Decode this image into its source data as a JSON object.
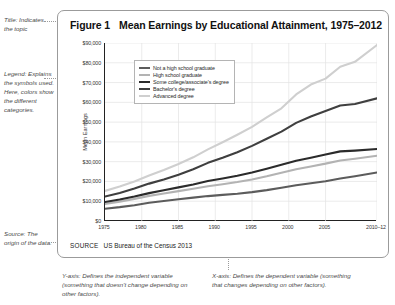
{
  "annotations": {
    "title_note": "Title: Indicates the topic",
    "legend_note": "Legend: Explains the symbols used. Here, colors show the different categories.",
    "source_note": "Source: The origin of the data.",
    "yaxis_note": "Y-axis: Defines the independent variable (something that doesn't change depending on other factors).",
    "xaxis_note": "X-axis: Defines the dependent variable (something that changes depending on other factors)."
  },
  "figure": {
    "number_label": "Figure 1",
    "title": "Mean Earnings by Educational Attainment, 1975–2012",
    "source_label": "SOURCE",
    "source_text": "US Bureau of the Census 2013"
  },
  "chart_data": {
    "type": "line",
    "title": "Mean Earnings by Educational Attainment, 1975–2012",
    "xlabel": "",
    "ylabel": "Mean Earnings",
    "xlim": [
      1975,
      2012
    ],
    "ylim": [
      0,
      90000
    ],
    "grid": true,
    "legend_position": "upper-left-inside",
    "xticks": [
      1975,
      1980,
      1985,
      1990,
      1995,
      2000,
      2005,
      2012
    ],
    "xtick_labels": [
      "1975",
      "1980",
      "1985",
      "1990",
      "1995",
      "2000",
      "2005",
      "2010–12"
    ],
    "yticks": [
      0,
      10000,
      20000,
      30000,
      40000,
      50000,
      60000,
      70000,
      80000,
      90000
    ],
    "ytick_labels": [
      "$0",
      "$10,000",
      "$20,000",
      "$30,000",
      "$40,000",
      "$50,000",
      "$60,000",
      "$70,000",
      "$80,000",
      "$90,000"
    ],
    "x": [
      1975,
      1977,
      1979,
      1981,
      1983,
      1985,
      1987,
      1989,
      1991,
      1993,
      1995,
      1997,
      1999,
      2001,
      2003,
      2005,
      2007,
      2009,
      2012
    ],
    "series": [
      {
        "name": "Not a high school graduate",
        "color": "#5c5c5c",
        "values": [
          6200,
          7000,
          8000,
          9200,
          10100,
          11000,
          11800,
          12600,
          13200,
          13800,
          14600,
          15600,
          16800,
          18100,
          19100,
          20100,
          21500,
          22600,
          24500
        ]
      },
      {
        "name": "High school graduate",
        "color": "#b3b3b3",
        "values": [
          8600,
          9800,
          11200,
          12700,
          13900,
          15100,
          16300,
          17600,
          18600,
          19700,
          21000,
          22600,
          24400,
          26200,
          27600,
          29000,
          30600,
          31500,
          33000
        ]
      },
      {
        "name": "Some college/associate's degree",
        "color": "#2b2b2b",
        "values": [
          9600,
          10900,
          12400,
          14100,
          15500,
          17000,
          18500,
          20200,
          21500,
          22900,
          24500,
          26400,
          28400,
          30500,
          32000,
          33600,
          35200,
          35600,
          36400
        ]
      },
      {
        "name": "Bachelor's degree",
        "color": "#3f3f3f",
        "values": [
          12400,
          14200,
          16400,
          18900,
          21000,
          23400,
          26200,
          29400,
          32000,
          34800,
          38000,
          41600,
          45200,
          49600,
          52800,
          55600,
          58400,
          59200,
          62000
        ]
      },
      {
        "name": "Advanced degree",
        "color": "#cfcfcf",
        "values": [
          15200,
          17400,
          20000,
          23000,
          25800,
          28800,
          32200,
          36200,
          39800,
          43600,
          47600,
          52400,
          57000,
          64000,
          69000,
          72000,
          78000,
          80500,
          89000
        ]
      }
    ]
  }
}
